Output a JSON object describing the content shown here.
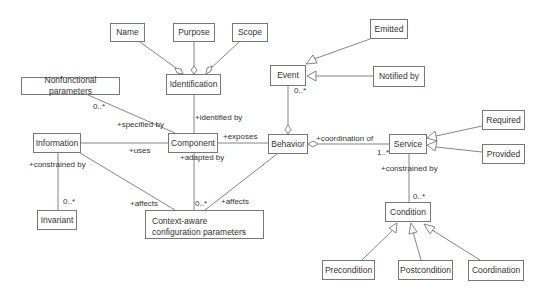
{
  "diagram": {
    "type": "UML class diagram",
    "classes": {
      "name": "Name",
      "purpose": "Purpose",
      "scope": "Scope",
      "identification": "Identification",
      "nonfunctional": "Nonfunctional parameters",
      "event": "Event",
      "emitted": "Emitted",
      "notified": "Notified by",
      "information": "Information",
      "component": "Component",
      "behavior": "Behavior",
      "service": "Service",
      "required": "Required",
      "provided": "Provided",
      "invariant": "Invariant",
      "context": "Context-aware configuration parameters",
      "condition": "Condition",
      "precondition": "Precondition",
      "postcondition": "Postcondition",
      "coordination": "Coordination"
    },
    "labels": {
      "specified_by": "+specified by",
      "nonfunc_mult": "0..*",
      "identified_by": "+identified by",
      "exposes": "+exposes",
      "uses": "+uses",
      "adapted_by": "+adapted by",
      "constrained_by_info": "+constrained by",
      "invariant_mult": "0..*",
      "affects_info": "+affects",
      "context_mult": "0..*",
      "affects_behavior": "+affects",
      "event_mult": "0..*",
      "coordination_of": "+coordination of",
      "service_mult": "1..*",
      "constrained_by_service": "+constrained by",
      "condition_mult": "0..*"
    }
  }
}
